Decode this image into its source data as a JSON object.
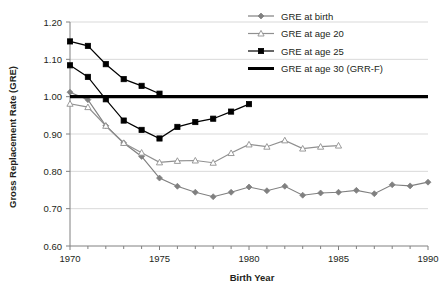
{
  "chart_data": {
    "type": "line",
    "title": "",
    "xlabel": "Birth Year",
    "ylabel": "Gross Replacement Rate (GRE)",
    "xlim": [
      1970,
      1990
    ],
    "ylim": [
      0.6,
      1.2
    ],
    "xticks": [
      1970,
      1975,
      1980,
      1985,
      1990
    ],
    "xticklabels": [
      "1970",
      "1975",
      "1980",
      "1985",
      "1990"
    ],
    "yticks": [
      0.6,
      0.7,
      0.8,
      0.9,
      1.0,
      1.1,
      1.2
    ],
    "yticklabels": [
      "0.60",
      "0.70",
      "0.80",
      "0.90",
      "1.00",
      "1.10",
      "1.20"
    ],
    "minor_xtick_interval": 1,
    "grid": "horizontal",
    "legend_position": "top-right",
    "series": [
      {
        "name": "GRE at birth",
        "color": "#808080",
        "marker": "diamond-filled",
        "x": [
          1970,
          1971,
          1972,
          1973,
          1974,
          1975,
          1976,
          1977,
          1978,
          1979,
          1980,
          1981,
          1982,
          1983,
          1984,
          1985,
          1986,
          1987,
          1988,
          1989,
          1990
        ],
        "values": [
          1.012,
          0.992,
          0.922,
          0.876,
          0.84,
          0.782,
          0.76,
          0.744,
          0.732,
          0.744,
          0.758,
          0.748,
          0.76,
          0.736,
          0.742,
          0.744,
          0.749,
          0.74,
          0.764,
          0.761,
          0.771
        ]
      },
      {
        "name": "GRE at age 20",
        "color": "#909090",
        "marker": "triangle-open",
        "x": [
          1970,
          1971,
          1972,
          1973,
          1974,
          1975,
          1976,
          1977,
          1978,
          1979,
          1980,
          1981,
          1982,
          1983,
          1984,
          1985
        ],
        "values": [
          0.981,
          0.972,
          0.922,
          0.876,
          0.85,
          0.824,
          0.828,
          0.829,
          0.823,
          0.849,
          0.872,
          0.866,
          0.883,
          0.861,
          0.866,
          0.869
        ]
      },
      {
        "name": "GRE at age 25",
        "color": "#000000",
        "marker": "square-filled",
        "x": [
          1970,
          1971,
          1972,
          1973,
          1974,
          1975,
          1976,
          1977,
          1978,
          1979,
          1980
        ],
        "values": [
          1.084,
          1.053,
          0.993,
          0.936,
          0.911,
          0.888,
          0.919,
          0.932,
          0.941,
          0.96,
          0.98
        ]
      },
      {
        "name": "GRE at age 30 (GRR-F)",
        "color": "#000000",
        "marker": "none",
        "x": [
          1970,
          1990
        ],
        "values": [
          1.0,
          1.0
        ]
      },
      {
        "name": "GRE at age 25 upper",
        "legend": false,
        "color": "#000000",
        "marker": "square-filled",
        "x": [
          1970,
          1971,
          1972,
          1973,
          1974,
          1975
        ],
        "values": [
          1.148,
          1.136,
          1.087,
          1.047,
          1.029,
          1.008
        ]
      }
    ],
    "legend_entries": [
      {
        "label": "GRE at birth",
        "color": "#808080",
        "marker": "diamond-filled"
      },
      {
        "label": "GRE at age 20",
        "color": "#909090",
        "marker": "triangle-open"
      },
      {
        "label": "GRE at age 25",
        "color": "#000000",
        "marker": "square-filled"
      },
      {
        "label": "GRE at age 30 (GRR-F)",
        "color": "#000000",
        "marker": "none"
      }
    ]
  }
}
